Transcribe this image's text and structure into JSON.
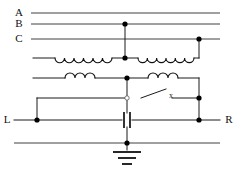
{
  "diagram": {
    "type": "circuit-schematic",
    "background_color": "#ffffff",
    "wire_color": "#1a1a1a"
  },
  "labels": {
    "phase_a": "A",
    "phase_b": "B",
    "phase_c": "C",
    "terminal_left": "L",
    "terminal_right": "R",
    "switch_mark": "x"
  },
  "components": {
    "bus_lines": [
      {
        "name": "A",
        "y": 13,
        "x1": 14,
        "x2": 220,
        "junctions": []
      },
      {
        "name": "B",
        "y": 24,
        "x1": 14,
        "x2": 220,
        "junctions": [
          125
        ]
      },
      {
        "name": "C",
        "y": 39,
        "x1": 14,
        "x2": 220,
        "junctions": [
          199
        ]
      },
      {
        "name": "neutral",
        "y": 143,
        "x1": 14,
        "x2": 220,
        "junctions": [
          127
        ]
      }
    ],
    "coils": [
      {
        "name": "transformer-coil-left",
        "humps": 6,
        "orientation": "down",
        "x1": 55,
        "x2": 112,
        "y": 58
      },
      {
        "name": "transformer-coil-right",
        "humps": 6,
        "orientation": "down",
        "x1": 138,
        "x2": 194,
        "y": 58
      },
      {
        "name": "inductor-left",
        "humps": 3,
        "orientation": "up",
        "x1": 65,
        "x2": 95,
        "y": 78
      },
      {
        "name": "inductor-right",
        "humps": 3,
        "orientation": "up",
        "x1": 148,
        "x2": 178,
        "y": 78
      }
    ],
    "switch": {
      "name": "disconnect-switch",
      "pivot_x": 141,
      "pivot_y": 98,
      "tip_x": 165,
      "tip_y": 90,
      "state": "open"
    },
    "capacitor": {
      "name": "capacitor",
      "x": 127,
      "y": 120,
      "plate_gap": 4,
      "plate_height": 15
    },
    "ground": {
      "name": "earth-ground",
      "x": 127,
      "y": 150,
      "bars": 3
    },
    "nodes": [
      {
        "x": 125,
        "y": 24
      },
      {
        "x": 199,
        "y": 39
      },
      {
        "x": 125,
        "y": 58
      },
      {
        "x": 127,
        "y": 78
      },
      {
        "x": 199,
        "y": 98
      },
      {
        "x": 199,
        "y": 120
      },
      {
        "x": 37,
        "y": 120
      },
      {
        "x": 127,
        "y": 143
      }
    ],
    "terminals": [
      {
        "name": "L",
        "x": 14,
        "y": 120
      },
      {
        "name": "R",
        "x": 220,
        "y": 120
      }
    ]
  }
}
